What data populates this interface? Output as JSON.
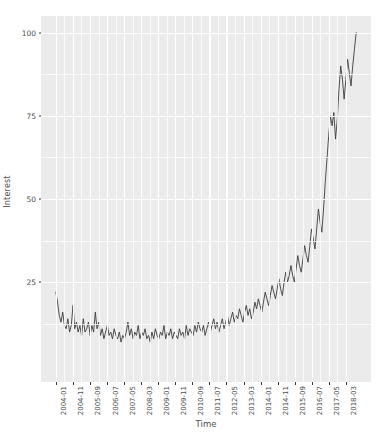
{
  "chart_data": {
    "type": "line",
    "title": "",
    "xlabel": "Time",
    "ylabel": "Interest",
    "ylim": [
      0,
      100
    ],
    "y_ticks": [
      25,
      50,
      75,
      100
    ],
    "y_minor_ticks": [
      12.5,
      37.5,
      62.5,
      87.5
    ],
    "grid": true,
    "legend": "none",
    "x_tick_labels": [
      "2004-01",
      "2004-11",
      "2005-09",
      "2006-07",
      "2007-05",
      "2008-03",
      "2009-01",
      "2009-11",
      "2010-09",
      "2011-07",
      "2012-05",
      "2013-03",
      "2014-01",
      "2014-11",
      "2015-09",
      "2016-07",
      "2017-05",
      "2018-03"
    ],
    "x_tick_indices": [
      0,
      10,
      20,
      30,
      40,
      50,
      60,
      70,
      80,
      90,
      100,
      110,
      120,
      130,
      140,
      150,
      160,
      170
    ],
    "x_index_max": 176,
    "series_name": "Interest",
    "line_color": "#3d3d3d",
    "panel_color": "#ebebeb",
    "grid_color": "#ffffff",
    "values": [
      22,
      19,
      15,
      13,
      16,
      12,
      11,
      14,
      10,
      12,
      18,
      11,
      13,
      10,
      12,
      9,
      14,
      10,
      11,
      13,
      9,
      12,
      10,
      16,
      11,
      13,
      9,
      11,
      8,
      10,
      12,
      9,
      10,
      8,
      11,
      9,
      8,
      10,
      7,
      9,
      8,
      10,
      13,
      9,
      11,
      8,
      10,
      9,
      12,
      8,
      10,
      9,
      11,
      8,
      9,
      7,
      10,
      8,
      11,
      9,
      8,
      10,
      9,
      12,
      8,
      10,
      9,
      11,
      8,
      10,
      9,
      8,
      11,
      9,
      10,
      8,
      12,
      9,
      11,
      10,
      9,
      12,
      10,
      13,
      11,
      10,
      12,
      9,
      11,
      13,
      10,
      12,
      14,
      11,
      13,
      10,
      12,
      14,
      11,
      13,
      15,
      12,
      14,
      16,
      13,
      15,
      14,
      17,
      15,
      13,
      16,
      18,
      15,
      17,
      14,
      16,
      19,
      17,
      20,
      18,
      16,
      19,
      22,
      20,
      18,
      21,
      24,
      22,
      20,
      23,
      26,
      23,
      21,
      25,
      28,
      25,
      27,
      30,
      27,
      25,
      29,
      33,
      30,
      28,
      32,
      36,
      33,
      31,
      36,
      41,
      38,
      35,
      41,
      47,
      43,
      40,
      47,
      55,
      62,
      69,
      75,
      72,
      76,
      68,
      74,
      83,
      90,
      86,
      80,
      86,
      92,
      88,
      84,
      90,
      95,
      100
    ]
  }
}
